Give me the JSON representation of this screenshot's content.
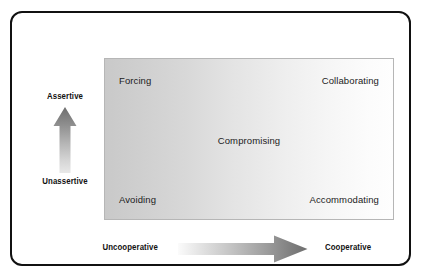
{
  "diagram": {
    "title_visible": false,
    "matrix": {
      "quadrants": [
        {
          "key": "forcing",
          "label": "Forcing",
          "position": "top-left"
        },
        {
          "key": "collaborating",
          "label": "Collaborating",
          "position": "top-right"
        },
        {
          "key": "compromising",
          "label": "Compromising",
          "position": "center"
        },
        {
          "key": "avoiding",
          "label": "Avoiding",
          "position": "bottom-left"
        },
        {
          "key": "accommodating",
          "label": "Accommodating",
          "position": "bottom-right"
        }
      ],
      "fill_gradient": {
        "direction": "left-to-right",
        "from": "#c9c9c9",
        "to": "#fefefe"
      },
      "border_color": "#b6b6b6"
    },
    "vertical_axis": {
      "high_label": "Assertive",
      "low_label": "Unassertive",
      "arrow_direction": "up",
      "arrow_gradient_from": "#6e6e6e",
      "arrow_gradient_to": "#e3e3e3"
    },
    "horizontal_axis": {
      "low_label": "Uncooperative",
      "high_label": "Cooperative",
      "arrow_direction": "right",
      "arrow_gradient_from": "#f2f2f2",
      "arrow_gradient_to": "#6e6e6e"
    },
    "frame": {
      "border_color": "#111111",
      "background_color": "#ffffff",
      "corner_radius_px": 12
    }
  }
}
